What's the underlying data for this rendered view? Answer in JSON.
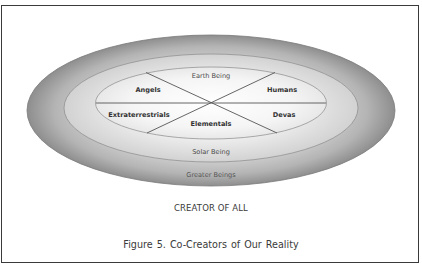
{
  "figure": {
    "caption": "Figure 5.  Co-Creators of Our Reality",
    "footer_label": "CREATOR OF ALL",
    "rings": {
      "outer": "Greater Beings",
      "middle": "Solar Being"
    },
    "inner_segments": {
      "top": "Earth Being",
      "upper_left": "Angels",
      "upper_right": "Humans",
      "lower_left": "Extraterrestrials",
      "lower_right": "Devas",
      "bottom": "Elementals"
    },
    "colors": {
      "frame_border": "#3a3a3a",
      "outer_ring_edge": "#8c8c8c",
      "inner_fill": "#f7f7f7",
      "line": "#555555",
      "text": "#333333"
    }
  }
}
